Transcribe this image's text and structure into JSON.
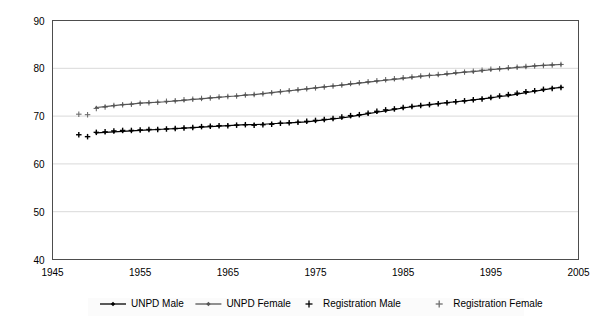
{
  "chart_data": {
    "type": "line",
    "title": "",
    "subtitle": "",
    "xlabel": "",
    "ylabel": "",
    "xlim": [
      1945,
      2005
    ],
    "ylim": [
      40,
      90
    ],
    "x_ticks": [
      1945,
      1955,
      1965,
      1975,
      1985,
      1995,
      2005
    ],
    "y_ticks": [
      40,
      50,
      60,
      70,
      80,
      90
    ],
    "grid": "horizontal",
    "legend_position": "bottom",
    "series": [
      {
        "name": "UNPD Male",
        "marker": "diamond",
        "line": true,
        "color": "#000000",
        "x": [
          1950,
          1951,
          1952,
          1953,
          1954,
          1955,
          1956,
          1957,
          1958,
          1959,
          1960,
          1961,
          1962,
          1963,
          1964,
          1965,
          1966,
          1967,
          1968,
          1969,
          1970,
          1971,
          1972,
          1973,
          1974,
          1975,
          1976,
          1977,
          1978,
          1979,
          1980,
          1981,
          1982,
          1983,
          1984,
          1985,
          1986,
          1987,
          1988,
          1989,
          1990,
          1991,
          1992,
          1993,
          1994,
          1995,
          1996,
          1997,
          1998,
          1999,
          2000,
          2001,
          2002,
          2003
        ],
        "values": [
          66.5,
          66.6,
          66.7,
          66.8,
          66.9,
          67.0,
          67.1,
          67.2,
          67.3,
          67.4,
          67.5,
          67.6,
          67.7,
          67.8,
          67.9,
          68.0,
          68.1,
          68.2,
          68.2,
          68.3,
          68.4,
          68.5,
          68.6,
          68.7,
          68.8,
          69.0,
          69.2,
          69.4,
          69.6,
          69.9,
          70.2,
          70.5,
          70.8,
          71.1,
          71.4,
          71.7,
          72.0,
          72.2,
          72.4,
          72.6,
          72.8,
          73.0,
          73.2,
          73.4,
          73.6,
          73.8,
          74.1,
          74.3,
          74.6,
          74.9,
          75.2,
          75.5,
          75.8,
          76.0
        ]
      },
      {
        "name": "UNPD Female",
        "marker": "diamond",
        "line": true,
        "color": "#555555",
        "x": [
          1950,
          1951,
          1952,
          1953,
          1954,
          1955,
          1956,
          1957,
          1958,
          1959,
          1960,
          1961,
          1962,
          1963,
          1964,
          1965,
          1966,
          1967,
          1968,
          1969,
          1970,
          1971,
          1972,
          1973,
          1974,
          1975,
          1976,
          1977,
          1978,
          1979,
          1980,
          1981,
          1982,
          1983,
          1984,
          1985,
          1986,
          1987,
          1988,
          1989,
          1990,
          1991,
          1992,
          1993,
          1994,
          1995,
          1996,
          1997,
          1998,
          1999,
          2000,
          2001,
          2002,
          2003
        ],
        "values": [
          71.8,
          72.0,
          72.2,
          72.4,
          72.5,
          72.7,
          72.8,
          72.9,
          73.0,
          73.2,
          73.3,
          73.5,
          73.6,
          73.8,
          73.9,
          74.1,
          74.2,
          74.4,
          74.5,
          74.7,
          74.9,
          75.1,
          75.3,
          75.5,
          75.7,
          75.9,
          76.1,
          76.3,
          76.5,
          76.7,
          76.9,
          77.1,
          77.3,
          77.5,
          77.7,
          77.9,
          78.1,
          78.3,
          78.5,
          78.6,
          78.8,
          79.0,
          79.2,
          79.3,
          79.5,
          79.7,
          79.9,
          80.0,
          80.2,
          80.3,
          80.5,
          80.6,
          80.7,
          80.8
        ]
      },
      {
        "name": "Registration Male",
        "marker": "plus",
        "line": false,
        "color": "#000000",
        "x": [
          1948,
          1949,
          1950,
          1951,
          1952,
          1953,
          1954,
          1955,
          1956,
          1957,
          1958,
          1959,
          1960,
          1961,
          1962,
          1963,
          1964,
          1965,
          1966,
          1967,
          1968,
          1969,
          1970,
          1971,
          1972,
          1973,
          1974,
          1975,
          1976,
          1977,
          1978,
          1979,
          1980,
          1981,
          1982,
          1983,
          1984,
          1985,
          1986,
          1987,
          1988,
          1989,
          1990,
          1991,
          1992,
          1993,
          1994,
          1995,
          1996,
          1997,
          1998,
          1999,
          2000,
          2001,
          2002,
          2003
        ],
        "values": [
          66.1,
          65.7,
          66.6,
          66.7,
          66.9,
          67.0,
          67.0,
          67.1,
          67.2,
          67.2,
          67.3,
          67.4,
          67.5,
          67.6,
          67.8,
          67.9,
          68.0,
          68.0,
          68.1,
          68.2,
          68.1,
          68.2,
          68.3,
          68.5,
          68.6,
          68.7,
          68.9,
          69.1,
          69.3,
          69.5,
          69.8,
          70.1,
          70.3,
          70.6,
          71.0,
          71.3,
          71.5,
          71.8,
          72.0,
          72.2,
          72.4,
          72.6,
          72.8,
          73.0,
          73.2,
          73.4,
          73.6,
          73.9,
          74.2,
          74.5,
          74.8,
          75.1,
          75.3,
          75.6,
          75.8,
          76.0
        ]
      },
      {
        "name": "Registration Female",
        "marker": "plus",
        "line": false,
        "color": "#6e6e6e",
        "x": [
          1948,
          1949,
          1950,
          1951,
          1952,
          1953,
          1954,
          1955,
          1956,
          1957,
          1958,
          1959,
          1960,
          1961,
          1962,
          1963,
          1964,
          1965,
          1966,
          1967,
          1968,
          1969,
          1970,
          1971,
          1972,
          1973,
          1974,
          1975,
          1976,
          1977,
          1978,
          1979,
          1980,
          1981,
          1982,
          1983,
          1984,
          1985,
          1986,
          1987,
          1988,
          1989,
          1990,
          1991,
          1992,
          1993,
          1994,
          1995,
          1996,
          1997,
          1998,
          1999,
          2000,
          2001,
          2002,
          2003
        ],
        "values": [
          70.4,
          70.3,
          71.6,
          71.9,
          72.2,
          72.4,
          72.5,
          72.7,
          72.8,
          72.9,
          73.1,
          73.2,
          73.4,
          73.5,
          73.7,
          73.8,
          74.0,
          74.1,
          74.2,
          74.4,
          74.5,
          74.7,
          74.9,
          75.1,
          75.3,
          75.5,
          75.7,
          75.9,
          76.1,
          76.3,
          76.5,
          76.8,
          77.0,
          77.2,
          77.4,
          77.6,
          77.8,
          78.0,
          78.2,
          78.4,
          78.5,
          78.7,
          78.9,
          79.1,
          79.2,
          79.4,
          79.6,
          79.8,
          79.9,
          80.1,
          80.2,
          80.4,
          80.5,
          80.6,
          80.7,
          80.8
        ]
      }
    ]
  },
  "legend": {
    "items": [
      {
        "label": "UNPD Male",
        "marker": "diamond-line",
        "color": "#000000"
      },
      {
        "label": "UNPD Female",
        "marker": "diamond-line",
        "color": "#555555"
      },
      {
        "label": "Registration Male",
        "marker": "plus",
        "color": "#000000"
      },
      {
        "label": "Registration Female",
        "marker": "plus",
        "color": "#6e6e6e"
      }
    ]
  },
  "axes": {
    "y_labels": [
      "90",
      "80",
      "70",
      "60",
      "50",
      "40"
    ],
    "x_labels": [
      "1945",
      "1955",
      "1965",
      "1975",
      "1985",
      "1995",
      "2005"
    ]
  }
}
